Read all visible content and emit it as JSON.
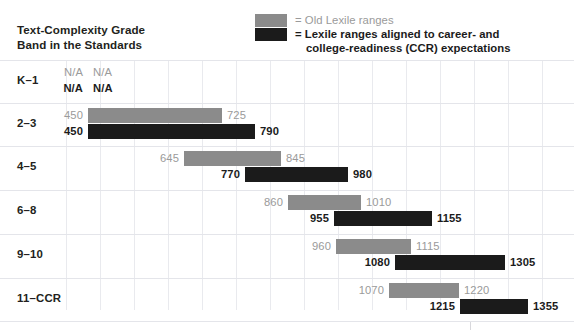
{
  "header": {
    "title_line1": "Text-Complexity Grade",
    "title_line2": "Band in the Standards"
  },
  "legend": {
    "old_label": "= Old Lexile ranges",
    "ccr_label_line1": "= Lexile ranges aligned to career- and",
    "ccr_label_line2": "college-readiness (CCR) expectations",
    "old_color": "#8b8b8b",
    "ccr_color": "#1b1b1b"
  },
  "chart_data": {
    "type": "bar",
    "title": "Text-Complexity Grade Band in the Standards",
    "xlabel": "Lexile measure",
    "ylabel": "Grade band",
    "orientation": "horizontal",
    "categories": [
      "K–1",
      "2–3",
      "4–5",
      "6–8",
      "9–10",
      "11–CCR"
    ],
    "legend": [
      "Old Lexile ranges",
      "Lexile ranges aligned to career- and college-readiness (CCR) expectations"
    ],
    "legend_position": "top-right",
    "grid": true,
    "xlim": [
      0,
      1500
    ],
    "series": [
      {
        "name": "Old Lexile ranges",
        "color": "#8b8b8b",
        "ranges": [
          {
            "category": "K–1",
            "low": null,
            "high": null,
            "low_label": "N/A",
            "high_label": "N/A"
          },
          {
            "category": "2–3",
            "low": 450,
            "high": 725,
            "low_label": "450",
            "high_label": "725"
          },
          {
            "category": "4–5",
            "low": 645,
            "high": 845,
            "low_label": "645",
            "high_label": "845"
          },
          {
            "category": "6–8",
            "low": 860,
            "high": 1010,
            "low_label": "860",
            "high_label": "1010"
          },
          {
            "category": "9–10",
            "low": 960,
            "high": 1115,
            "low_label": "960",
            "high_label": "1115"
          },
          {
            "category": "11–CCR",
            "low": 1070,
            "high": 1220,
            "low_label": "1070",
            "high_label": "1220"
          }
        ]
      },
      {
        "name": "Lexile ranges aligned to career- and college-readiness (CCR) expectations",
        "color": "#1b1b1b",
        "ranges": [
          {
            "category": "K–1",
            "low": null,
            "high": null,
            "low_label": "N/A",
            "high_label": "N/A"
          },
          {
            "category": "2–3",
            "low": 450,
            "high": 790,
            "low_label": "450",
            "high_label": "790"
          },
          {
            "category": "4–5",
            "low": 770,
            "high": 980,
            "low_label": "770",
            "high_label": "980"
          },
          {
            "category": "6–8",
            "low": 955,
            "high": 1155,
            "low_label": "955",
            "high_label": "1155"
          },
          {
            "category": "9–10",
            "low": 1080,
            "high": 1305,
            "low_label": "1080",
            "high_label": "1305"
          },
          {
            "category": "11–CCR",
            "low": 1215,
            "high": 1355,
            "low_label": "1215",
            "high_label": "1355"
          }
        ]
      }
    ]
  },
  "rows": [
    {
      "label": "K–1",
      "old": {
        "start_px": 88,
        "end_px": 88,
        "low": "N/A",
        "high": "N/A",
        "empty": true
      },
      "ccr": {
        "start_px": 88,
        "end_px": 88,
        "low": "N/A",
        "high": "N/A",
        "empty": true
      }
    },
    {
      "label": "2–3",
      "old": {
        "start_px": 88,
        "end_px": 222,
        "low": "450",
        "high": "725",
        "empty": false
      },
      "ccr": {
        "start_px": 88,
        "end_px": 255,
        "low": "450",
        "high": "790",
        "empty": false
      }
    },
    {
      "label": "4–5",
      "old": {
        "start_px": 184,
        "end_px": 281,
        "low": "645",
        "high": "845",
        "empty": false
      },
      "ccr": {
        "start_px": 245,
        "end_px": 348,
        "low": "770",
        "high": "980",
        "empty": false
      }
    },
    {
      "label": "6–8",
      "old": {
        "start_px": 288,
        "end_px": 361,
        "low": "860",
        "high": "1010",
        "empty": false
      },
      "ccr": {
        "start_px": 334,
        "end_px": 432,
        "low": "955",
        "high": "1155",
        "empty": false
      }
    },
    {
      "label": "9–10",
      "old": {
        "start_px": 336,
        "end_px": 411,
        "low": "960",
        "high": "1115",
        "empty": false
      },
      "ccr": {
        "start_px": 395,
        "end_px": 505,
        "low": "1080",
        "high": "1305",
        "empty": false
      }
    },
    {
      "label": "11–CCR",
      "old": {
        "start_px": 389,
        "end_px": 459,
        "low": "1070",
        "high": "1220",
        "empty": false
      },
      "ccr": {
        "start_px": 460,
        "end_px": 528,
        "low": "1215",
        "high": "1355",
        "empty": false
      }
    }
  ],
  "grid": {
    "vlines_px": [
      66,
      100,
      134,
      168,
      202,
      236,
      270,
      304,
      338,
      372,
      406,
      440,
      474,
      508,
      542
    ],
    "hlines_px": [
      60,
      103,
      146,
      190,
      234,
      278,
      321
    ]
  }
}
